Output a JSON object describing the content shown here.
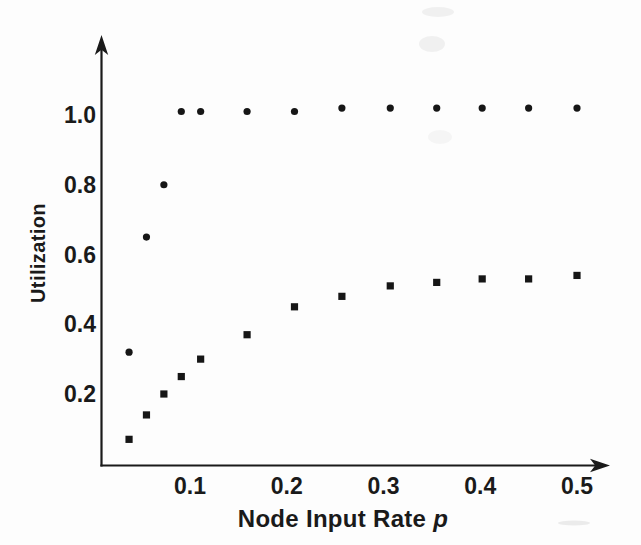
{
  "figure": {
    "background": "#fdfdfd",
    "ink_color": "#1a1a1a",
    "xlabel_main": "Node Input Rate",
    "xlabel_var": "p",
    "ylabel": "Utilization"
  },
  "chart_data": {
    "type": "scatter",
    "title": "",
    "xlabel": "Node Input Rate p",
    "ylabel": "Utilization",
    "xlim": [
      0,
      0.53
    ],
    "ylim": [
      0,
      1.23
    ],
    "grid": false,
    "legend": "none",
    "axis_style": "arrow-ended, no tick marks",
    "x_ticks": [
      0.1,
      0.2,
      0.3,
      0.4,
      0.5
    ],
    "x_tick_labels": [
      "0.1",
      "0.2",
      "0.3",
      "0.4",
      "0.5"
    ],
    "y_ticks": [
      0.2,
      0.4,
      0.6,
      0.8,
      1.0
    ],
    "y_tick_labels": [
      "0.2",
      "0.4",
      "0.6",
      "0.8",
      "1.0"
    ],
    "x": [
      0.037,
      0.055,
      0.073,
      0.091,
      0.111,
      0.159,
      0.208,
      0.257,
      0.307,
      0.355,
      0.402,
      0.45,
      0.5
    ],
    "series": [
      {
        "name": "circle-markers",
        "marker": "circle",
        "color": "#161616",
        "y": [
          0.32,
          0.65,
          0.8,
          1.01,
          1.01,
          1.01,
          1.01,
          1.02,
          1.02,
          1.02,
          1.02,
          1.02,
          1.02
        ]
      },
      {
        "name": "square-markers",
        "marker": "square",
        "color": "#161616",
        "y": [
          0.07,
          0.14,
          0.2,
          0.25,
          0.3,
          0.37,
          0.45,
          0.48,
          0.51,
          0.52,
          0.53,
          0.53,
          0.54
        ]
      }
    ]
  }
}
